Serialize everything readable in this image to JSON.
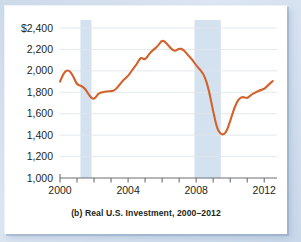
{
  "figure": {
    "caption": "(b) Real U.S. Investment, 2000–2012"
  },
  "colors": {
    "line": "#d4602a",
    "recession_band": "#d4e2f0",
    "gridline": "#dfe5ea",
    "axis": "#6d6e71",
    "text": "#231f20",
    "card_background": "#ffffff",
    "page_background": "#cddaea"
  },
  "chart_data": {
    "type": "line",
    "title": "(b) Real U.S. Investment, 2000–2012",
    "xlabel": "",
    "ylabel": "",
    "xlim": [
      2000,
      2012.75
    ],
    "ylim": [
      1000,
      2400
    ],
    "grid": true,
    "legend": "none",
    "y_ticks": [
      1000,
      1200,
      1400,
      1600,
      1800,
      2000,
      2200,
      2400
    ],
    "y_tick_labels": [
      "1,000",
      "1,200",
      "1,400",
      "1,600",
      "1,800",
      "2,000",
      "2,200",
      "$2,400"
    ],
    "x_ticks": [
      2000,
      2001,
      2002,
      2003,
      2004,
      2005,
      2006,
      2007,
      2008,
      2009,
      2010,
      2011,
      2012
    ],
    "x_tick_labels_shown": [
      "2000",
      "2004",
      "2008",
      "2012"
    ],
    "x_labeled_ticks": [
      2000,
      2004,
      2008,
      2012
    ],
    "annotations": [
      {
        "type": "recession_band",
        "label": "2001 recession",
        "x_start": 2001.2,
        "x_end": 2001.85
      },
      {
        "type": "recession_band",
        "label": "2007-2009 recession",
        "x_start": 2007.9,
        "x_end": 2009.45
      }
    ],
    "series": [
      {
        "name": "Real U.S. Investment",
        "units": "billions of 2005 dollars",
        "x": [
          2000.0,
          2000.25,
          2000.5,
          2000.75,
          2001.0,
          2001.25,
          2001.5,
          2001.75,
          2002.0,
          2002.25,
          2002.5,
          2002.75,
          2003.0,
          2003.25,
          2003.5,
          2003.75,
          2004.0,
          2004.25,
          2004.5,
          2004.75,
          2005.0,
          2005.25,
          2005.5,
          2005.75,
          2006.0,
          2006.25,
          2006.5,
          2006.75,
          2007.0,
          2007.25,
          2007.5,
          2007.75,
          2008.0,
          2008.25,
          2008.5,
          2008.75,
          2009.0,
          2009.25,
          2009.5,
          2009.75,
          2010.0,
          2010.25,
          2010.5,
          2010.75,
          2011.0,
          2011.25,
          2011.5,
          2011.75,
          2012.0,
          2012.25,
          2012.5
        ],
        "y": [
          1900,
          1990,
          2010,
          1960,
          1870,
          1860,
          1830,
          1760,
          1730,
          1790,
          1800,
          1810,
          1810,
          1820,
          1870,
          1920,
          1950,
          2010,
          2060,
          2130,
          2100,
          2160,
          2200,
          2230,
          2290,
          2260,
          2210,
          2180,
          2210,
          2200,
          2150,
          2110,
          2050,
          2010,
          1950,
          1820,
          1620,
          1450,
          1400,
          1420,
          1530,
          1660,
          1740,
          1760,
          1740,
          1780,
          1800,
          1820,
          1830,
          1870,
          1905
        ]
      }
    ]
  }
}
